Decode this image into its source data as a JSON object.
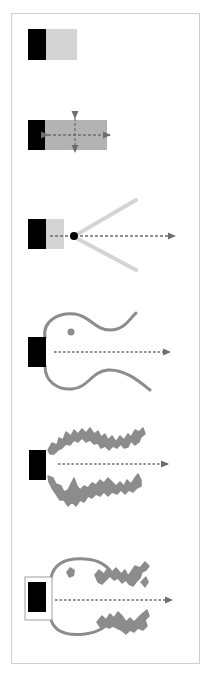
{
  "colors": {
    "black": "#000000",
    "light_gray": "#d4d4d4",
    "mid_gray": "#b3b3b3",
    "curve_gray": "#8c8c8c",
    "arrow_gray": "#6e6e6e",
    "frame": "#cfcfcf"
  },
  "panels": [
    {
      "id": 1,
      "name": "source-with-light-block"
    },
    {
      "id": 2,
      "name": "source-with-gray-block-and-cross-arrows"
    },
    {
      "id": 3,
      "name": "source-with-point-and-diverging-lines"
    },
    {
      "id": 4,
      "name": "source-with-smooth-curved-walls"
    },
    {
      "id": 5,
      "name": "source-with-rough-crinkled-walls"
    },
    {
      "id": 6,
      "name": "boxed-source-with-mixed-walls"
    }
  ]
}
